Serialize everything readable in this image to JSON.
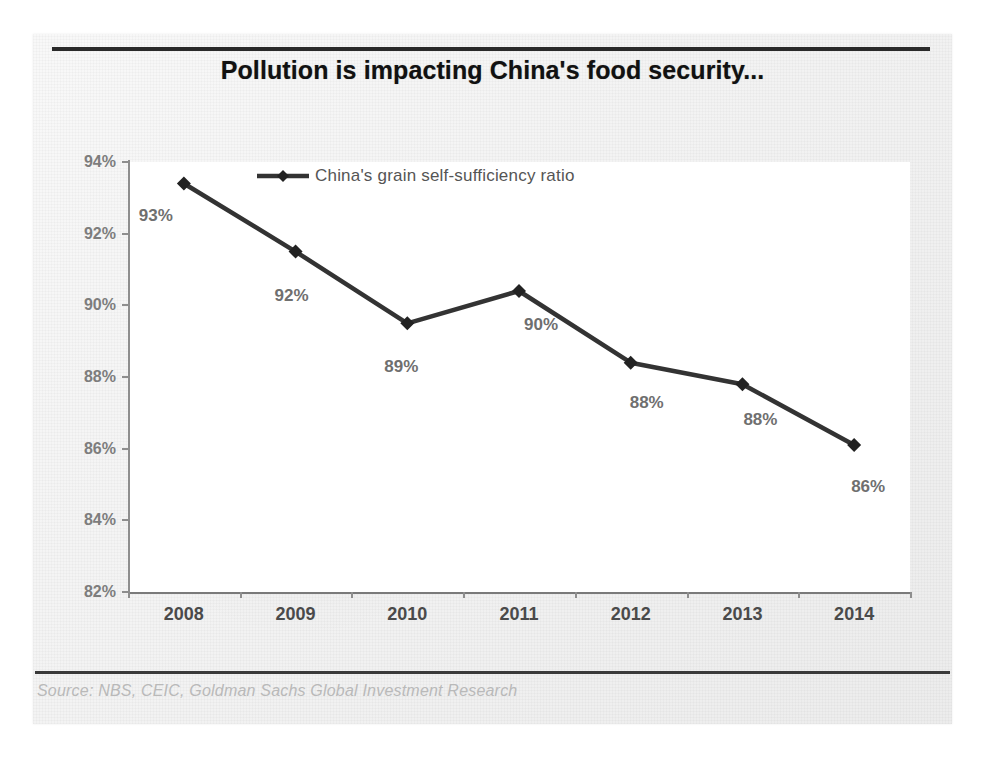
{
  "chart_data": {
    "type": "line",
    "title": "Pollution is impacting China's food security...",
    "xlabel": "",
    "ylabel": "",
    "categories": [
      "2008",
      "2009",
      "2010",
      "2011",
      "2012",
      "2013",
      "2014"
    ],
    "series": [
      {
        "name": "China's grain self-sufficiency ratio",
        "values": [
          93.4,
          91.5,
          89.5,
          90.4,
          88.4,
          87.8,
          86.1
        ],
        "point_labels": [
          "93%",
          "92%",
          "89%",
          "90%",
          "88%",
          "88%",
          "86%"
        ]
      }
    ],
    "ylim": [
      82,
      94
    ],
    "ytick_values": [
      94,
      92,
      90,
      88,
      86,
      84,
      82
    ],
    "ytick_labels": [
      "94%",
      "92%",
      "90%",
      "88%",
      "86%",
      "84%",
      "82%"
    ],
    "grid": false,
    "legend_position": "inside-top-left",
    "marker": "diamond",
    "line_color": "#333333",
    "marker_color": "#222222",
    "source": "Source: NBS, CEIC, Goldman Sachs Global Investment Research"
  },
  "legend": {
    "entries": [
      {
        "label": "China's grain self-sufficiency ratio",
        "marker": "diamond-line-marker",
        "color": "#333333"
      }
    ]
  },
  "footer": {
    "source_text": "Source: NBS, CEIC, Goldman Sachs Global Investment Research"
  },
  "colors": {
    "line": "#333333",
    "axis": "#8e8e8e",
    "title": "#111111",
    "tick_label": "#7d7d7d",
    "x_tick_label": "#4a4a4a",
    "point_label": "#6f6f6f",
    "source": "#b9b9b9",
    "panel_background": "#f0f0f0",
    "plot_background": "#ffffff"
  }
}
